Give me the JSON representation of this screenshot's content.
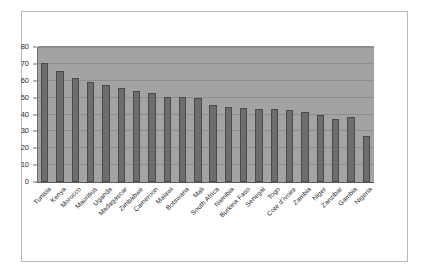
{
  "chart_data": {
    "type": "bar",
    "title": "",
    "subtitle": "",
    "xlabel": "",
    "ylabel": "",
    "ylim": [
      0,
      80
    ],
    "ytick_step": 10,
    "yticks": [
      "0",
      "10",
      "20",
      "30",
      "40",
      "50",
      "60",
      "70",
      "80"
    ],
    "grid": true,
    "legend": false,
    "orientation": "vertical",
    "sort": "descending",
    "categories": [
      "Tunisia",
      "Kenya",
      "Morocco",
      "Mauritius",
      "Uganda",
      "Madagascar",
      "Zimbabwe",
      "Cameroon",
      "Malawi",
      "Botswana",
      "Mali",
      "South Africa",
      "Namibia",
      "Burkina Faso",
      "Senegal",
      "Togo",
      "Cote d'Ivoire",
      "Zambia",
      "Niger",
      "Zanzibar",
      "Gambia",
      "Nigeria"
    ],
    "values": [
      70.5,
      65.5,
      61.5,
      59.0,
      57.5,
      56.0,
      54.0,
      52.5,
      50.5,
      50.5,
      49.5,
      45.5,
      44.5,
      44.0,
      43.5,
      43.5,
      42.5,
      41.5,
      40.0,
      37.5,
      38.5,
      27.5
    ],
    "colors": {
      "bar_fill": "#6d6d6d",
      "bar_border": "#4a4a4a",
      "plot_background": "#a3a3a3",
      "gridline": "#8e8e8e",
      "axis": "#5d5d5d",
      "page_background": "#ffffff",
      "frame_border": "#b9b9b9",
      "text": "#232323"
    }
  }
}
